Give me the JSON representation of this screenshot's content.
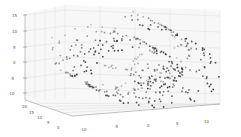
{
  "chart_data": {
    "type": "scatter",
    "projection": "3d",
    "title": "",
    "xlabel": "",
    "ylabel": "",
    "zlabel": "",
    "grid": true,
    "legend": null,
    "point_color": "#333333",
    "x_axis": {
      "ticks": [
        "-10",
        "-5",
        "0",
        "5",
        "10"
      ],
      "range": [
        -12,
        12
      ]
    },
    "y_axis": {
      "ticks": [
        "0",
        "5",
        "10",
        "15",
        "20"
      ],
      "range": [
        0,
        21
      ]
    },
    "z_axis": {
      "ticks": [
        "15",
        "10",
        "5",
        "0",
        "-5",
        "-10"
      ],
      "range": [
        -12,
        16
      ]
    }
  },
  "axes": {
    "z_ticks": [
      {
        "label": "15",
        "x": 18,
        "y": 15
      },
      {
        "label": "10",
        "x": 18,
        "y": 31
      },
      {
        "label": "5",
        "x": 19,
        "y": 47
      },
      {
        "label": "0",
        "x": 19,
        "y": 62
      },
      {
        "label": "-5",
        "x": 16,
        "y": 78
      },
      {
        "label": "-10",
        "x": 14,
        "y": 93
      }
    ],
    "y_ticks": [
      {
        "label": "20",
        "x": 22,
        "y": 108
      },
      {
        "label": "15",
        "x": 29,
        "y": 114
      },
      {
        "label": "10",
        "x": 37,
        "y": 119
      },
      {
        "label": "5",
        "x": 47,
        "y": 124
      },
      {
        "label": "0",
        "x": 57,
        "y": 129
      }
    ],
    "x_ticks": [
      {
        "label": "-10",
        "x": 80,
        "y": 131
      },
      {
        "label": "-5",
        "x": 114,
        "y": 128
      },
      {
        "label": "0",
        "x": 147,
        "y": 127
      },
      {
        "label": "5",
        "x": 176,
        "y": 125
      },
      {
        "label": "10",
        "x": 204,
        "y": 123
      }
    ]
  }
}
